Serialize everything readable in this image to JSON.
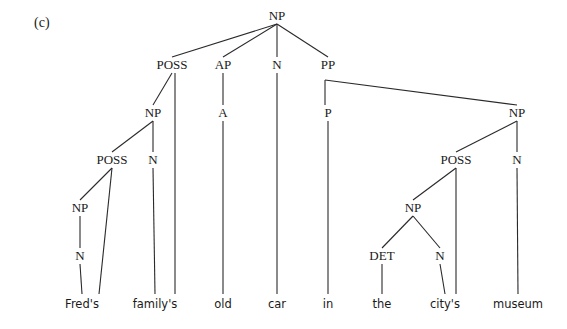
{
  "caption": "(c)",
  "nodes": [
    {
      "id": "np_root",
      "label": "NP"
    },
    {
      "id": "poss1",
      "label": "POSS"
    },
    {
      "id": "ap",
      "label": "AP"
    },
    {
      "id": "n_car",
      "label": "N"
    },
    {
      "id": "pp",
      "label": "PP"
    },
    {
      "id": "np_family",
      "label": "NP"
    },
    {
      "id": "a_old",
      "label": "A"
    },
    {
      "id": "p_in",
      "label": "P"
    },
    {
      "id": "np_museum",
      "label": "NP"
    },
    {
      "id": "poss_fred",
      "label": "POSS"
    },
    {
      "id": "n_family",
      "label": "N"
    },
    {
      "id": "poss_city",
      "label": "POSS"
    },
    {
      "id": "n_museum",
      "label": "N"
    },
    {
      "id": "np_fred",
      "label": "NP"
    },
    {
      "id": "np_thecity",
      "label": "NP"
    },
    {
      "id": "n_fred",
      "label": "N"
    },
    {
      "id": "det_the",
      "label": "DET"
    },
    {
      "id": "n_city",
      "label": "N"
    }
  ],
  "words": [
    {
      "id": "w_freds",
      "text": "Fred's"
    },
    {
      "id": "w_familys",
      "text": "family's"
    },
    {
      "id": "w_old",
      "text": "old"
    },
    {
      "id": "w_car",
      "text": "car"
    },
    {
      "id": "w_in",
      "text": "in"
    },
    {
      "id": "w_the",
      "text": "the"
    },
    {
      "id": "w_citys",
      "text": "city's"
    },
    {
      "id": "w_museum",
      "text": "museum"
    }
  ],
  "edges": [
    [
      "np_root",
      "poss1"
    ],
    [
      "np_root",
      "ap"
    ],
    [
      "np_root",
      "n_car"
    ],
    [
      "np_root",
      "pp"
    ],
    [
      "poss1",
      "np_family"
    ],
    [
      "poss1",
      "w_familys"
    ],
    [
      "ap",
      "a_old"
    ],
    [
      "a_old",
      "w_old"
    ],
    [
      "n_car",
      "w_car"
    ],
    [
      "pp",
      "p_in"
    ],
    [
      "pp",
      "np_museum"
    ],
    [
      "p_in",
      "w_in"
    ],
    [
      "np_family",
      "poss_fred"
    ],
    [
      "np_family",
      "n_family"
    ],
    [
      "n_family",
      "w_familys"
    ],
    [
      "poss_fred",
      "np_fred"
    ],
    [
      "poss_fred",
      "w_freds"
    ],
    [
      "np_fred",
      "n_fred"
    ],
    [
      "n_fred",
      "w_freds"
    ],
    [
      "np_museum",
      "poss_city"
    ],
    [
      "np_museum",
      "n_museum"
    ],
    [
      "n_museum",
      "w_museum"
    ],
    [
      "poss_city",
      "np_thecity"
    ],
    [
      "poss_city",
      "w_citys"
    ],
    [
      "np_thecity",
      "det_the"
    ],
    [
      "np_thecity",
      "n_city"
    ],
    [
      "det_the",
      "w_the"
    ],
    [
      "n_city",
      "w_citys"
    ]
  ]
}
